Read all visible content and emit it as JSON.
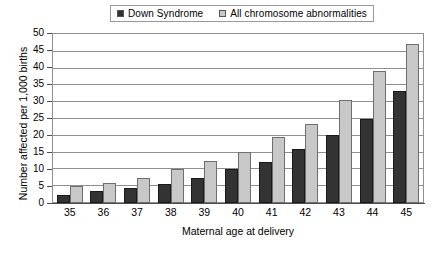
{
  "chart_data": {
    "type": "bar",
    "title": "",
    "xlabel": "Maternal age at delivery",
    "ylabel": "Number affected per 1,000 births",
    "categories": [
      "35",
      "36",
      "37",
      "38",
      "39",
      "40",
      "41",
      "42",
      "43",
      "44",
      "45"
    ],
    "series": [
      {
        "name": "Down Syndrome",
        "color": "#333333",
        "values": [
          2.5,
          3.5,
          4.5,
          5.5,
          7.5,
          10,
          12,
          16,
          20,
          25,
          33
        ]
      },
      {
        "name": "All chromosome abnormalities",
        "color": "#c8c8c8",
        "values": [
          5,
          6,
          7.5,
          10,
          12.5,
          15,
          19.5,
          23.5,
          30.5,
          39,
          47
        ]
      }
    ],
    "ylim": [
      0,
      50
    ],
    "ytick_step": 5,
    "yticks": [
      "50",
      "45",
      "40",
      "35",
      "30",
      "25",
      "20",
      "15",
      "10",
      "5",
      "0"
    ],
    "grid": true,
    "legend_position": "top-center"
  },
  "legend": {
    "entries": [
      {
        "label": "Down Syndrome",
        "swatch_color": "#333333"
      },
      {
        "label": "All chromosome abnormalities",
        "swatch_color": "#c8c8c8"
      }
    ]
  }
}
